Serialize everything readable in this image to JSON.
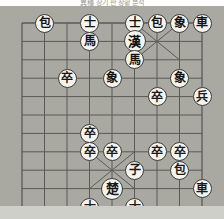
{
  "caption": {
    "text": "異種 장기 판 상황 분석"
  },
  "colors": {
    "board_background": "#a9a9a2",
    "grid_line": "#5a5a56",
    "piece_face": "#f2f1ec",
    "piece_border": "#4a4a48",
    "black_text": "#141414",
    "red_text": "#1a1a1a",
    "page_background": "#ffffff",
    "footer_strip": "#cfcfc9"
  },
  "board": {
    "name": "janggi-board",
    "columns": 9,
    "rows": 10,
    "grid": true,
    "origin_x": 22,
    "origin_y": 17,
    "cell_width": 22.5,
    "cell_height": 18.4,
    "palaces": [
      {
        "side": "black",
        "center_col": 6,
        "center_row": 1
      },
      {
        "side": "red",
        "center_col": 4,
        "center_row": 8
      }
    ]
  },
  "pieces": [
    {
      "id": "p01",
      "glyph": "包",
      "name": "black-cannon-left",
      "side": "black",
      "col": 1,
      "row": 0,
      "king": false
    },
    {
      "id": "p02",
      "glyph": "士",
      "name": "black-guard-left",
      "side": "black",
      "col": 3,
      "row": 0,
      "king": false
    },
    {
      "id": "p03",
      "glyph": "馬",
      "name": "black-horse-left",
      "side": "black",
      "col": 3,
      "row": 1,
      "king": false
    },
    {
      "id": "p04",
      "glyph": "士",
      "name": "black-guard-right",
      "side": "black",
      "col": 5,
      "row": 0,
      "king": false
    },
    {
      "id": "p05",
      "glyph": "包",
      "name": "black-cannon-right",
      "side": "black",
      "col": 6,
      "row": 0,
      "king": false
    },
    {
      "id": "p06",
      "glyph": "象",
      "name": "black-elephant",
      "side": "black",
      "col": 7,
      "row": 0,
      "king": false
    },
    {
      "id": "p07",
      "glyph": "車",
      "name": "black-chariot-right",
      "side": "black",
      "col": 8,
      "row": 0,
      "king": false
    },
    {
      "id": "p08",
      "glyph": "漢",
      "name": "black-king",
      "side": "black",
      "col": 5,
      "row": 1,
      "king": true
    },
    {
      "id": "p09",
      "glyph": "馬",
      "name": "black-horse-right",
      "side": "black",
      "col": 5,
      "row": 2,
      "king": false
    },
    {
      "id": "p10",
      "glyph": "卒",
      "name": "red-soldier-a",
      "side": "red",
      "col": 2,
      "row": 3,
      "king": false
    },
    {
      "id": "p11",
      "glyph": "象",
      "name": "black-elephant-mid",
      "side": "black",
      "col": 4,
      "row": 3,
      "king": false
    },
    {
      "id": "p12",
      "glyph": "象",
      "name": "black-elephant-far",
      "side": "black",
      "col": 7,
      "row": 3,
      "king": false
    },
    {
      "id": "p13",
      "glyph": "卒",
      "name": "red-soldier-b",
      "side": "red",
      "col": 6,
      "row": 4,
      "king": false
    },
    {
      "id": "p14",
      "glyph": "兵",
      "name": "red-soldier-c",
      "side": "red",
      "col": 8,
      "row": 4,
      "king": false
    },
    {
      "id": "p15",
      "glyph": "卒",
      "name": "red-soldier-d",
      "side": "red",
      "col": 3,
      "row": 6,
      "king": false
    },
    {
      "id": "p16",
      "glyph": "卒",
      "name": "red-soldier-e",
      "side": "red",
      "col": 3,
      "row": 7,
      "king": false
    },
    {
      "id": "p17",
      "glyph": "卒",
      "name": "red-soldier-f",
      "side": "red",
      "col": 4,
      "row": 7,
      "king": false
    },
    {
      "id": "p18",
      "glyph": "卒",
      "name": "red-soldier-g",
      "side": "red",
      "col": 6,
      "row": 7,
      "king": false
    },
    {
      "id": "p19",
      "glyph": "卒",
      "name": "red-soldier-h",
      "side": "red",
      "col": 7,
      "row": 7,
      "king": false
    },
    {
      "id": "p20",
      "glyph": "子",
      "name": "red-cannon-left",
      "side": "red",
      "col": 5,
      "row": 8,
      "king": false
    },
    {
      "id": "p21",
      "glyph": "包",
      "name": "red-cannon-right",
      "side": "red",
      "col": 7,
      "row": 8,
      "king": false
    },
    {
      "id": "p22",
      "glyph": "楚",
      "name": "red-king",
      "side": "red",
      "col": 4,
      "row": 9,
      "king": true
    },
    {
      "id": "p23",
      "glyph": "車",
      "name": "red-chariot",
      "side": "red",
      "col": 8,
      "row": 9,
      "king": false
    },
    {
      "id": "p24",
      "glyph": "士",
      "name": "red-guard-left",
      "side": "red",
      "col": 3,
      "row": 10,
      "king": false
    },
    {
      "id": "p25",
      "glyph": "士",
      "name": "red-guard-right",
      "side": "red",
      "col": 5,
      "row": 10,
      "king": false
    }
  ]
}
